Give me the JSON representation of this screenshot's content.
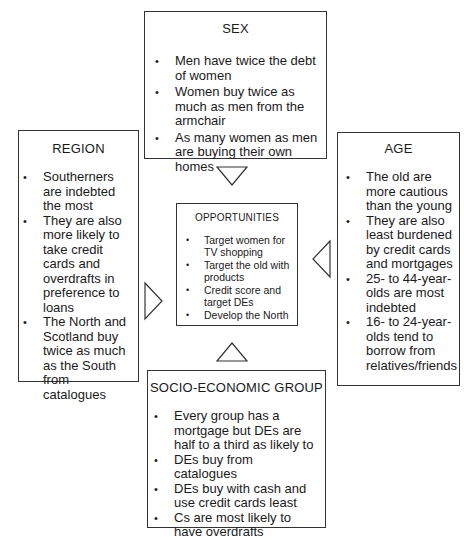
{
  "diagram": {
    "sex": {
      "title": "SEX",
      "items": [
        "Men have twice the debt of women",
        "Women buy twice as much as men from the armchair",
        "As many women as men are buying their own homes"
      ]
    },
    "region": {
      "title": "REGION",
      "items": [
        "Southerners are indebted the most",
        "They are also more likely to take credit cards and overdrafts in preference to loans",
        "The North and Scotland buy twice as much as the South from catalogues"
      ]
    },
    "age": {
      "title": "AGE",
      "items": [
        "The old are more cautious than the young",
        "They are also least burdened by credit cards and mortgages",
        "25- to 44-year-olds are most indebted",
        "16- to 24-year-olds tend to borrow from relatives/friends"
      ]
    },
    "opportunities": {
      "title": "OPPORTUNITIES",
      "items": [
        "Target women for TV shopping",
        "Target the old with products",
        "Credit score and target DEs",
        "Develop the North"
      ]
    },
    "socio_economic": {
      "title": "SOCIO-ECONOMIC GROUP",
      "items": [
        "Every group has a mortgage but DEs are half to a third as likely to",
        "DEs buy from catalogues",
        "DEs buy with cash and use credit cards least",
        "Cs are most likely to have overdrafts"
      ]
    },
    "arrows": [
      "down-from-sex",
      "right-from-region",
      "left-from-age",
      "up-from-socio-economic"
    ]
  }
}
